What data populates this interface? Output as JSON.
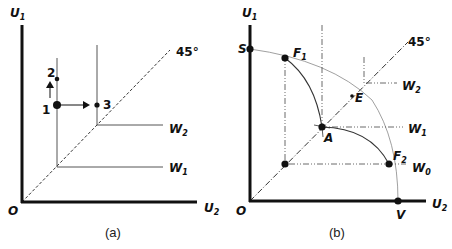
{
  "panels": [
    {
      "id": "a",
      "caption": "(a)",
      "axes": {
        "y_label": "U",
        "y_sub": "1",
        "x_label": "U",
        "x_sub": "2",
        "origin_label": "O"
      },
      "diagonal_label": "45°",
      "indifference_labels": [
        {
          "label": "W",
          "sub": "1"
        },
        {
          "label": "W",
          "sub": "2"
        }
      ],
      "points": [
        {
          "label": "1"
        },
        {
          "label": "2"
        },
        {
          "label": "3"
        }
      ]
    },
    {
      "id": "b",
      "caption": "(b)",
      "axes": {
        "y_label": "U",
        "y_sub": "1",
        "x_label": "U",
        "x_sub": "2",
        "origin_label": "O"
      },
      "diagonal_label": "45°",
      "indifference_labels": [
        {
          "label": "W",
          "sub": "2"
        },
        {
          "label": "W",
          "sub": "1"
        },
        {
          "label": "W",
          "sub": "0"
        }
      ],
      "points": [
        {
          "label": "S"
        },
        {
          "label": "F",
          "sub": "1"
        },
        {
          "label": "A"
        },
        {
          "label": "E"
        },
        {
          "label": "F",
          "sub": "2"
        },
        {
          "label": "V"
        }
      ]
    }
  ]
}
